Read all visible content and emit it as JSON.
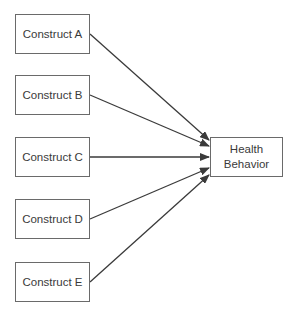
{
  "diagram": {
    "type": "path-diagram",
    "nodes": [
      {
        "id": "A",
        "label": "Construct A",
        "x": 15,
        "y": 14,
        "w": 75,
        "h": 40
      },
      {
        "id": "B",
        "label": "Construct B",
        "x": 15,
        "y": 75,
        "w": 75,
        "h": 40
      },
      {
        "id": "C",
        "label": "Construct C",
        "x": 15,
        "y": 137,
        "w": 75,
        "h": 40
      },
      {
        "id": "D",
        "label": "Construct D",
        "x": 15,
        "y": 199,
        "w": 75,
        "h": 40
      },
      {
        "id": "E",
        "label": "Construct E",
        "x": 15,
        "y": 262,
        "w": 75,
        "h": 40
      }
    ],
    "target": {
      "id": "HB",
      "label_line1": "Health",
      "label_line2": "Behavior",
      "x": 210,
      "y": 137,
      "w": 73,
      "h": 40
    },
    "edges": [
      {
        "from": "A",
        "to": "HB",
        "x1": 90,
        "y1": 34,
        "x2": 209,
        "y2": 140
      },
      {
        "from": "B",
        "to": "HB",
        "x1": 90,
        "y1": 95,
        "x2": 209,
        "y2": 146
      },
      {
        "from": "C",
        "to": "HB",
        "x1": 90,
        "y1": 157,
        "x2": 209,
        "y2": 157
      },
      {
        "from": "D",
        "to": "HB",
        "x1": 90,
        "y1": 219,
        "x2": 209,
        "y2": 168
      },
      {
        "from": "E",
        "to": "HB",
        "x1": 90,
        "y1": 282,
        "x2": 209,
        "y2": 175
      }
    ],
    "colors": {
      "stroke": "#3a3a3a",
      "border": "#6a6a6a",
      "text": "#3a3a3a"
    }
  }
}
